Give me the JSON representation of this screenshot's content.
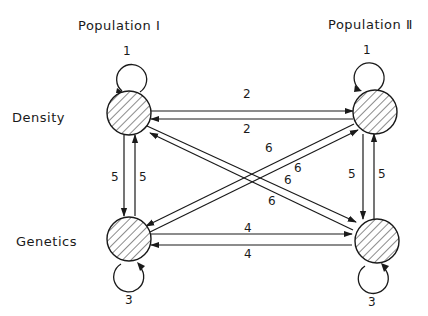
{
  "columns": {
    "pop1": "Population Ⅰ",
    "pop2": "Population Ⅱ"
  },
  "rows": {
    "density": "Density",
    "genetics": "Genetics"
  },
  "nodes": [
    {
      "id": "density-I",
      "row": "Density",
      "population": "Population I"
    },
    {
      "id": "density-II",
      "row": "Density",
      "population": "Population II"
    },
    {
      "id": "genetics-I",
      "row": "Genetics",
      "population": "Population I"
    },
    {
      "id": "genetics-II",
      "row": "Genetics",
      "population": "Population II"
    }
  ],
  "edges": {
    "loop_density_I": "1",
    "loop_density_II": "1",
    "loop_genetics_I": "3",
    "loop_genetics_II": "3",
    "density_I_to_II": "2",
    "density_II_to_I": "2",
    "genetics_I_to_II": "4",
    "genetics_II_to_I": "4",
    "pop1_density_to_genetics": "5",
    "pop1_genetics_to_density": "5",
    "pop2_density_to_genetics": "5",
    "pop2_genetics_to_density": "5",
    "genetics_I_to_density_II": "6",
    "density_II_to_genetics_I": "6",
    "density_I_to_genetics_II": "6",
    "genetics_II_to_density_I": "6"
  },
  "colors": {
    "ink": "#1a1a1a",
    "background": "#ffffff"
  }
}
